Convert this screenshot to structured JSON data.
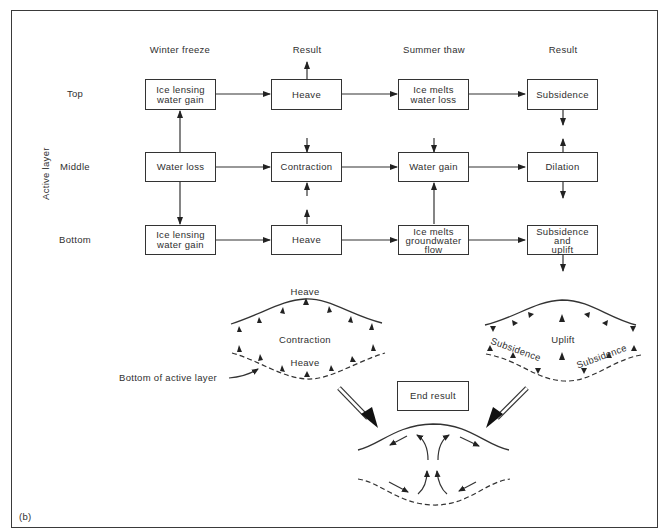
{
  "figure": {
    "panel_label": "(b)",
    "axis_label": "Active layer",
    "columns": [
      {
        "id": "winter",
        "header": "Winter freeze"
      },
      {
        "id": "result1",
        "header": "Result"
      },
      {
        "id": "summer",
        "header": "Summer thaw"
      },
      {
        "id": "result2",
        "header": "Result"
      }
    ],
    "rows": [
      {
        "id": "top",
        "label": "Top"
      },
      {
        "id": "middle",
        "label": "Middle"
      },
      {
        "id": "bottom",
        "label": "Bottom"
      }
    ],
    "boxes": {
      "top": {
        "winter": [
          "Ice lensing",
          "water gain"
        ],
        "result1": [
          "Heave"
        ],
        "summer": [
          "Ice melts",
          "water loss"
        ],
        "result2": [
          "Subsidence"
        ]
      },
      "middle": {
        "winter": [
          "Water loss"
        ],
        "result1": [
          "Contraction"
        ],
        "summer": [
          "Water gain"
        ],
        "result2": [
          "Dilation"
        ]
      },
      "bottom": {
        "winter": [
          "Ice lensing",
          "water gain"
        ],
        "result1": [
          "Heave"
        ],
        "summer": [
          "Ice melts",
          "groundwater",
          "flow"
        ],
        "result2": [
          "Subsidence",
          "and",
          "uplift"
        ]
      }
    },
    "left_sketch": {
      "top_label": "Heave",
      "center_label": "Contraction",
      "bottom_label": "Heave",
      "callout": "Bottom of active layer"
    },
    "right_sketch": {
      "center_label": "Uplift",
      "left_label": "Subsidence",
      "right_label": "Subsidence"
    },
    "end_result": {
      "label": "End result"
    }
  }
}
